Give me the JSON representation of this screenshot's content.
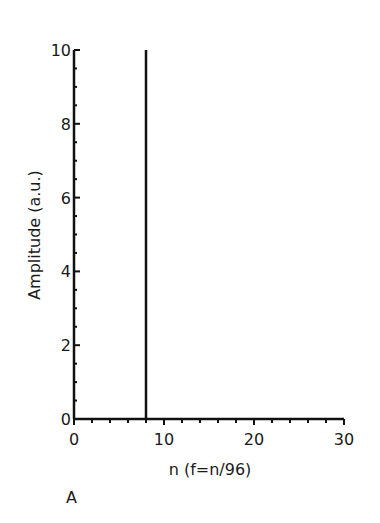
{
  "chart_data": {
    "type": "bar",
    "title": "",
    "panel_label": "A",
    "xlabel": "n (f=n/96)",
    "ylabel": "Amplitude (a.u.)",
    "xlim": [
      0,
      30
    ],
    "ylim": [
      0,
      10
    ],
    "x_ticks": [
      0,
      10,
      20,
      30
    ],
    "y_ticks": [
      0,
      2,
      4,
      6,
      8,
      10
    ],
    "x_minor_step": 2,
    "y_minor_step": 0.5,
    "grid": false,
    "legend": null,
    "x": [
      8
    ],
    "values": [
      10
    ]
  },
  "labels": {
    "xlabel": "n (f=n/96)",
    "ylabel": "Amplitude (a.u.)",
    "panel": "A",
    "xticks": [
      "0",
      "10",
      "20",
      "30"
    ],
    "yticks": [
      "0",
      "2",
      "4",
      "6",
      "8",
      "10"
    ]
  }
}
